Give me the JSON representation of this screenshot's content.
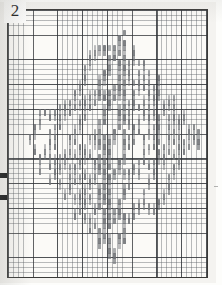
{
  "document": {
    "kind": "scanned-needlework-chart",
    "index_number": "2",
    "paper_color": "#f4f3f0",
    "frame_color": "#3a3a38",
    "grid_minor_color": "#5a5f64",
    "grid_major_color": "#2d3034",
    "stitch_color": "#6f7276",
    "numeral_color": "#1a1a1a"
  },
  "grid": {
    "cell_px": 4.95,
    "major_every": 5,
    "columns": 40,
    "rows": 54
  },
  "chart_data": {
    "type": "heatmap",
    "title": "2",
    "xlabel": "",
    "ylabel": "",
    "grid_columns": 40,
    "grid_rows": 54,
    "motif": {
      "shape": "diamond",
      "apex_top": [
        22,
        5
      ],
      "apex_bottom": [
        20,
        47
      ],
      "apex_left": [
        4,
        27
      ],
      "apex_right": [
        38,
        28
      ],
      "band_count": 5,
      "zigzag_period": 8,
      "zigzag_amplitude": 3
    },
    "legend": [],
    "annotations": [
      {
        "text": "2",
        "x": 1,
        "y": 0,
        "role": "chart-index-number"
      }
    ],
    "edge_marks": [
      {
        "side": "left",
        "y_px": 173
      },
      {
        "side": "left",
        "y_px": 195
      }
    ]
  }
}
